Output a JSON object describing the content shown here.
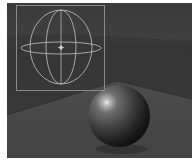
{
  "viewport": {
    "label": "3D render viewport",
    "colors": {
      "background": "#3a3a3a",
      "far_plane": "#454545",
      "ground": "#4a4a4a",
      "gizmo": "#8a8a8a",
      "sphere_highlight": "#e8e8e8",
      "sphere_mid": "#5e5e5e",
      "sphere_shadow": "#151515"
    },
    "objects": [
      {
        "type": "light-gizmo",
        "shape": "sphere-wireframe-in-box"
      },
      {
        "type": "sphere",
        "shading": "smooth"
      },
      {
        "type": "ground-plane"
      }
    ]
  }
}
